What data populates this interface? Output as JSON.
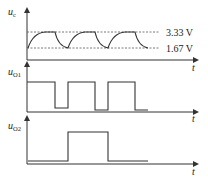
{
  "diagram": {
    "panels": [
      {
        "id": "uc",
        "ylabel_main": "u",
        "ylabel_sub": "c",
        "xlabel": "t",
        "levels": [
          {
            "label": "3.33 V",
            "value": 3.33
          },
          {
            "label": "1.67 V",
            "value": 1.67
          }
        ],
        "waveform": "capacitor charge/discharge between 1.67 V and 3.33 V, 3 cycles"
      },
      {
        "id": "uo1",
        "ylabel_main": "u",
        "ylabel_sub": "O1",
        "xlabel": "t",
        "waveform": "square wave, high-low pulses aligned with charging (high) and discharging (low)"
      },
      {
        "id": "uo2",
        "ylabel_main": "u",
        "ylabel_sub": "O2",
        "xlabel": "t",
        "waveform": "single wide pulse, half frequency of uO1"
      }
    ]
  }
}
